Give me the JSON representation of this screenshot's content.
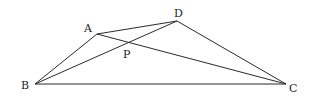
{
  "diagram": {
    "points": {
      "A": {
        "x": 97,
        "y": 34,
        "label": "A",
        "lx": 84,
        "ly": 32
      },
      "D": {
        "x": 177,
        "y": 21,
        "label": "D",
        "lx": 174,
        "ly": 17
      },
      "B": {
        "x": 35,
        "y": 84,
        "label": "B",
        "lx": 21,
        "ly": 89
      },
      "C": {
        "x": 286,
        "y": 84,
        "label": "C",
        "lx": 289,
        "ly": 92
      },
      "P": {
        "x": 128,
        "y": 43,
        "label": "P",
        "lx": 123,
        "ly": 58
      }
    },
    "segments": [
      {
        "from": "B",
        "to": "A"
      },
      {
        "from": "A",
        "to": "D"
      },
      {
        "from": "D",
        "to": "C"
      },
      {
        "from": "B",
        "to": "C"
      },
      {
        "from": "B",
        "to": "D"
      },
      {
        "from": "A",
        "to": "C"
      }
    ],
    "colors": {
      "stroke": "#2a2a2a",
      "label": "#222222",
      "background": "#ffffff"
    }
  }
}
